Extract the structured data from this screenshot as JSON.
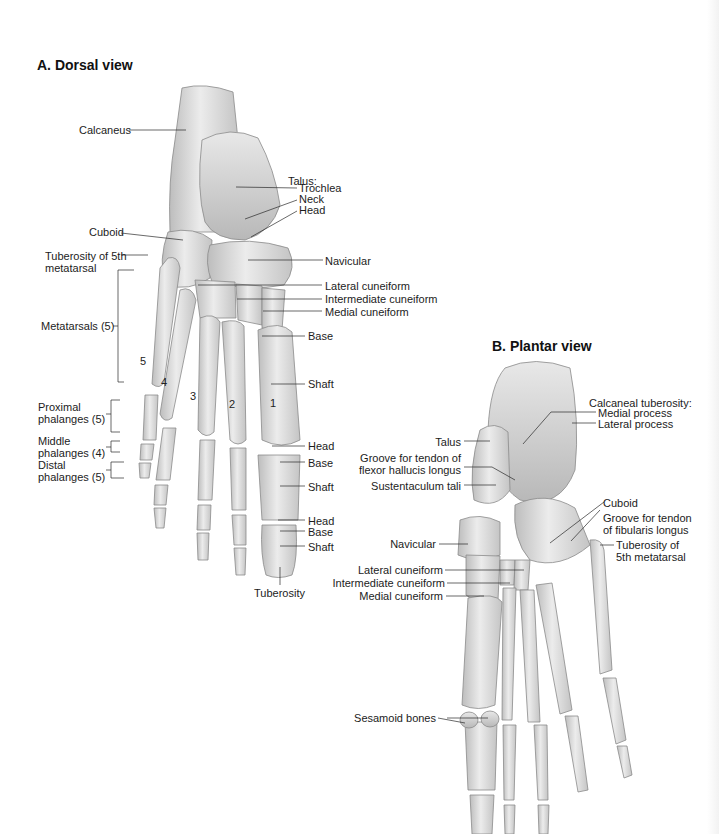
{
  "figure": {
    "edge_color": "#f2f2f2",
    "bone_fill": "#d9d9d9",
    "bone_stroke": "#8a8a8a",
    "leader_color": "#2a2a2a"
  },
  "dorsal": {
    "title": "A. Dorsal view",
    "labels": {
      "calcaneus": "Calcaneus",
      "talus": "Talus:",
      "trochlea": "Trochlea",
      "neck": "Neck",
      "head": "Head",
      "cuboid": "Cuboid",
      "tuberosity_5th_line1": "Tuberosity of 5th",
      "tuberosity_5th_line2": "metatarsal",
      "navicular": "Navicular",
      "lateral_cuneiform": "Lateral cuneiform",
      "intermediate_cuneiform": "Intermediate cuneiform",
      "medial_cuneiform": "Medial cuneiform",
      "metatarsals": "Metatarsals (5)",
      "mt_base": "Base",
      "mt_shaft": "Shaft",
      "mt_head": "Head",
      "prox_base": "Base",
      "prox_shaft": "Shaft",
      "prox_head": "Head",
      "dist_base": "Base",
      "dist_shaft": "Shaft",
      "tuberosity": "Tuberosity",
      "proximal_line1": "Proximal",
      "proximal_line2": "phalanges (5)",
      "middle_line1": "Middle",
      "middle_line2": "phalanges (4)",
      "distal_line1": "Distal",
      "distal_line2": "phalanges (5)"
    },
    "digit_numbers": [
      "1",
      "2",
      "3",
      "4",
      "5"
    ]
  },
  "plantar": {
    "title": "B. Plantar view",
    "labels": {
      "calcaneal_tuberosity": "Calcaneal tuberosity:",
      "medial_process": "Medial process",
      "lateral_process": "Lateral process",
      "talus": "Talus",
      "groove_fhl_line1": "Groove for tendon of",
      "groove_fhl_line2": "flexor hallucis longus",
      "sustentaculum": "Sustentaculum tali",
      "cuboid": "Cuboid",
      "groove_fl_line1": "Groove for tendon",
      "groove_fl_line2": "of fibularis longus",
      "tuberosity_5th_line1": "Tuberosity of",
      "tuberosity_5th_line2": "5th metatarsal",
      "navicular": "Navicular",
      "lateral_cuneiform": "Lateral cuneiform",
      "intermediate_cuneiform": "Intermediate cuneiform",
      "medial_cuneiform": "Medial cuneiform",
      "sesamoid": "Sesamoid bones"
    }
  }
}
